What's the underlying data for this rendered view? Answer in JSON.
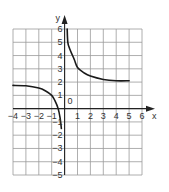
{
  "chart_data": {
    "type": "line",
    "title": "",
    "xlabel": "x",
    "ylabel": "y",
    "xlim": [
      -4,
      6
    ],
    "ylim": [
      -5,
      6
    ],
    "grid": true,
    "legend": null,
    "origin_label": "0",
    "x_ticks": [
      -4,
      -3,
      -2,
      -1,
      1,
      2,
      3,
      4,
      5,
      6
    ],
    "y_ticks": [
      -5,
      -4,
      -3,
      -2,
      -1,
      1,
      2,
      3,
      4,
      5,
      6
    ],
    "series": [
      {
        "name": "left-branch",
        "x": [
          -4,
          -3,
          -2,
          -1.5,
          -1,
          -0.75,
          -0.5,
          -0.35,
          -0.25
        ],
        "y": [
          1.75,
          1.72,
          1.55,
          1.35,
          1.0,
          0.6,
          0.0,
          -0.7,
          -1.5
        ]
      },
      {
        "name": "right-branch",
        "x": [
          0.2,
          0.25,
          0.4,
          0.75,
          1,
          1.5,
          2,
          3,
          4,
          5
        ],
        "y": [
          6,
          5,
          4.5,
          3.7,
          3.1,
          2.7,
          2.45,
          2.2,
          2.1,
          2.1
        ]
      }
    ]
  },
  "labels": {
    "x_axis": "x",
    "y_axis": "y",
    "origin": "0",
    "x_ticks": [
      "−4",
      "−3",
      "−2",
      "−1",
      "1",
      "2",
      "3",
      "4",
      "5",
      "6"
    ],
    "y_ticks_pos": [
      "6",
      "5",
      "4",
      "3",
      "2",
      "1"
    ],
    "y_ticks_neg": [
      "−1",
      "−2",
      "−3",
      "−4",
      "−5"
    ]
  },
  "colors": {
    "grid": "#9a9a9a",
    "axis": "#222222",
    "curve": "#1a1a1a",
    "background": "#ffffff"
  }
}
